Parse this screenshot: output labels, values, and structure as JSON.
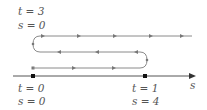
{
  "colors": {
    "path": "#8a8a8a",
    "axis": "#555555",
    "arrow": "#6a6a6a",
    "dot": "#111111",
    "text": "#555555"
  },
  "labels": {
    "top_left": {
      "t_line": "t = 3",
      "s_line": "s = 0"
    },
    "bottom_left": {
      "t_line": "t = 0",
      "s_line": "s = 0"
    },
    "bottom_right": {
      "t_line": "t = 1",
      "s_line": "s = 4"
    },
    "axis": "s"
  },
  "diagram": {
    "axis_points": [
      {
        "name": "origin",
        "t": 0,
        "s": 0
      },
      {
        "name": "turnaround",
        "t": 1,
        "s": 4
      }
    ],
    "path_segments": [
      {
        "direction": "right",
        "level": "bottom"
      },
      {
        "direction": "left",
        "level": "middle"
      },
      {
        "direction": "right",
        "level": "top"
      }
    ]
  }
}
